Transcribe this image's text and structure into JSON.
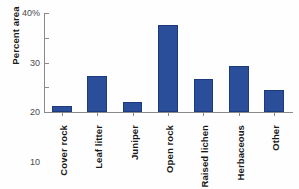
{
  "chart_data": {
    "type": "bar",
    "title": "",
    "xlabel": "",
    "ylabel": "Percent area",
    "categories": [
      "Cover rock",
      "Leaf litter",
      "Juniper",
      "Open rock",
      "Raised lichen",
      "Herbaceous",
      "Other"
    ],
    "values": [
      2.5,
      14.5,
      4,
      35,
      13.5,
      18.5,
      9
    ],
    "ylim": [
      0,
      40
    ],
    "yticks": [
      0,
      10,
      20,
      30,
      40
    ],
    "ytick_labels": [
      "0",
      "10",
      "20",
      "30",
      "40%"
    ],
    "grid": false,
    "legend": null,
    "bar_color": "#2b4e9b",
    "bar_edge_color": "#1d3a7c",
    "axis_color": "#8a8a8e",
    "series": [
      {
        "name": "Percent area",
        "values": [
          2.5,
          14.5,
          4,
          35,
          13.5,
          18.5,
          9
        ]
      }
    ]
  }
}
